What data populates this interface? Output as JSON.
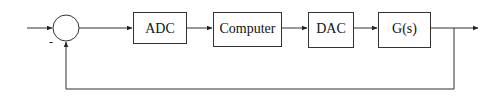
{
  "diagram": {
    "type": "feedback-control-block-diagram",
    "summing_junction": {
      "feedback_sign": "-"
    },
    "blocks": [
      {
        "id": "adc",
        "label": "ADC"
      },
      {
        "id": "computer",
        "label": "Computer"
      },
      {
        "id": "dac",
        "label": "DAC"
      },
      {
        "id": "plant",
        "label": "G(s)"
      }
    ],
    "connections": [
      {
        "from": "input",
        "to": "summing_junction"
      },
      {
        "from": "summing_junction",
        "to": "adc"
      },
      {
        "from": "adc",
        "to": "computer"
      },
      {
        "from": "computer",
        "to": "dac"
      },
      {
        "from": "dac",
        "to": "plant"
      },
      {
        "from": "plant",
        "to": "output"
      },
      {
        "from": "output",
        "to": "summing_junction",
        "kind": "feedback",
        "sign": "-"
      }
    ],
    "colors": {
      "line": "#333333",
      "background": "#ffffff"
    }
  }
}
